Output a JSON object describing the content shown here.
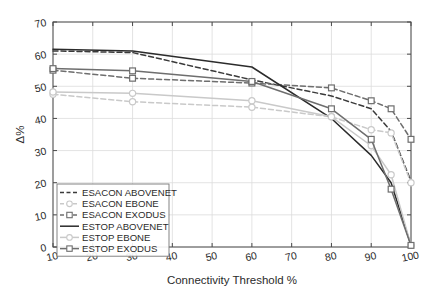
{
  "chart_data": {
    "type": "line",
    "title": "",
    "xlabel": "Connectivity Threshold %",
    "ylabel": "Δ%",
    "xlim": [
      10,
      100
    ],
    "ylim": [
      0,
      70
    ],
    "xticks": [
      10,
      20,
      30,
      40,
      50,
      60,
      70,
      80,
      90,
      100
    ],
    "yticks": [
      0,
      10,
      20,
      30,
      40,
      50,
      60,
      70
    ],
    "grid": true,
    "legend_position": "lower left",
    "x": [
      10,
      30,
      60,
      80,
      90,
      95,
      100
    ],
    "series": [
      {
        "name": "ESACON ABOVENET",
        "values": [
          61.0,
          60.5,
          52.0,
          47.0,
          43.0,
          36.0,
          20.5
        ],
        "color": "#3a3a3a",
        "dash": "5,3",
        "marker": "none",
        "width": 1.5
      },
      {
        "name": "ESACON EBONE",
        "values": [
          47.5,
          45.2,
          43.5,
          40.5,
          36.5,
          35.5,
          20.0
        ],
        "color": "#c9c9c9",
        "dash": "5,3",
        "marker": "circle",
        "width": 1.5
      },
      {
        "name": "ESACON EXODUS",
        "values": [
          55.0,
          52.5,
          51.0,
          49.5,
          45.5,
          43.0,
          33.5
        ],
        "color": "#6e6e6e",
        "dash": "5,3",
        "marker": "square",
        "width": 1.5
      },
      {
        "name": "ESTOP ABOVENET",
        "values": [
          61.5,
          61.0,
          56.0,
          40.0,
          28.5,
          20.0,
          0.5
        ],
        "color": "#2b2b2b",
        "dash": "none",
        "marker": "none",
        "width": 1.5
      },
      {
        "name": "ESTOP EBONE",
        "values": [
          48.2,
          47.8,
          45.5,
          40.5,
          31.5,
          22.5,
          0.5
        ],
        "color": "#c9c9c9",
        "dash": "none",
        "marker": "circle",
        "width": 1.5
      },
      {
        "name": "ESTOP EXODUS",
        "values": [
          55.5,
          54.8,
          51.5,
          43.0,
          33.5,
          18.0,
          0.5
        ],
        "color": "#6e6e6e",
        "dash": "none",
        "marker": "square",
        "width": 1.5
      }
    ],
    "legend_entries": [
      "ESACON ABOVENET",
      "ESACON EBONE",
      "ESACON EXODUS",
      "ESTOP ABOVENET",
      "ESTOP EBONE",
      "ESTOP EXODUS"
    ]
  }
}
